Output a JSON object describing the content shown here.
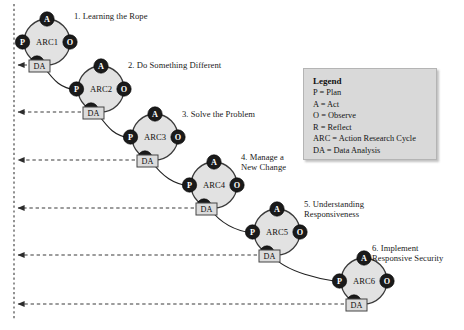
{
  "diagram": {
    "background_color": "#ffffff",
    "node_fill": "#e2e2e2",
    "node_stroke": "#3a3a3a",
    "marker_fill": "#1a1a1a",
    "marker_text_color": "#ffffff",
    "da_box_fill": "#dcdcdc",
    "da_box_stroke": "#444444",
    "dashed_line_color": "#3a3a3a",
    "legend_fill": "#d9d9d9"
  },
  "cycles": [
    {
      "id": "ARC1",
      "label": "ARC1",
      "title": "1. Learning the Rope",
      "cx": 47,
      "cy": 42,
      "r": 23,
      "title_x": 74,
      "title_y": 11,
      "da_label": "DA",
      "da_x": 29,
      "da_y": 60,
      "feedback_y": 65
    },
    {
      "id": "ARC2",
      "label": "ARC2",
      "title": "2. Do Something Different",
      "cx": 101,
      "cy": 89,
      "r": 23,
      "title_x": 128,
      "title_y": 60,
      "da_label": "DA",
      "da_x": 83,
      "da_y": 107,
      "feedback_y": 112
    },
    {
      "id": "ARC3",
      "label": "ARC3",
      "title": "3. Solve the Problem",
      "cx": 155,
      "cy": 137,
      "r": 23,
      "title_x": 182,
      "title_y": 109,
      "da_label": "DA",
      "da_x": 137,
      "da_y": 155,
      "feedback_y": 160
    },
    {
      "id": "ARC4",
      "label": "ARC4",
      "title": "4. Manage a\nNew Change",
      "cx": 214,
      "cy": 185,
      "r": 23,
      "title_x": 241,
      "title_y": 152,
      "da_label": "DA",
      "da_x": 196,
      "da_y": 203,
      "feedback_y": 208
    },
    {
      "id": "ARC5",
      "label": "ARC5",
      "title": "5. Understanding\nResponsiveness",
      "cx": 277,
      "cy": 232,
      "r": 23,
      "title_x": 304,
      "title_y": 199,
      "da_label": "DA",
      "da_x": 259,
      "da_y": 250,
      "feedback_y": 255
    },
    {
      "id": "ARC6",
      "label": "ARC6",
      "title": "6. Implement\nResponsive Security",
      "cx": 364,
      "cy": 281,
      "r": 23,
      "title_x": 372,
      "title_y": 243,
      "da_label": "DA",
      "da_x": 346,
      "da_y": 299,
      "feedback_y": 304
    }
  ],
  "stage_markers": {
    "plan": "P",
    "act": "A",
    "observe": "O",
    "reflect": "R"
  },
  "feedback_axis": {
    "x": 14,
    "y_top": 4,
    "y_bottom": 320
  },
  "legend": {
    "title": "Legend",
    "entries": [
      "P = Plan",
      "A = Act",
      "O = Observe",
      "R = Reflect",
      "ARC = Action Research Cycle",
      "DA = Data Analysis"
    ]
  }
}
